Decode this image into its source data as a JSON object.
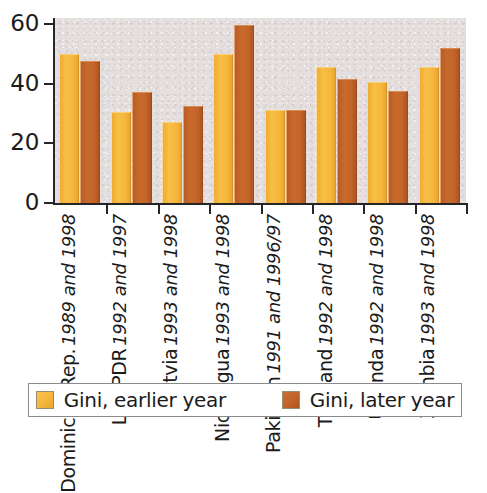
{
  "chart_data": {
    "type": "bar",
    "title": "",
    "subtitle": "",
    "xlabel": "",
    "ylabel": "",
    "ylim": [
      0,
      62
    ],
    "yticks": [
      0,
      20,
      40,
      60
    ],
    "ytick_labels": [
      "0",
      "20",
      "40",
      "60"
    ],
    "grid": false,
    "legend_position": "bottom",
    "categories": [
      "Dominican Rep.",
      "Lao PDR",
      "Latvia",
      "Nicaragua",
      "Pakistan",
      "Thailand",
      "Uganda",
      "Zambia"
    ],
    "category_years": [
      "1989 and 1998",
      "1992 and 1997",
      "1993 and 1998",
      "1993 and 1998",
      "1991 and 1996/97",
      "1992 and 1998",
      "1992 and 1998",
      "1993 and 1998"
    ],
    "series": [
      {
        "name": "Gini, earlier year",
        "color": "#f5b63c",
        "values": [
          50.0,
          30.5,
          27.0,
          50.0,
          31.3,
          45.5,
          40.5,
          45.7
        ]
      },
      {
        "name": "Gini, later year",
        "color": "#c2632a",
        "values": [
          47.5,
          37.3,
          32.5,
          59.8,
          31.3,
          41.5,
          37.5,
          52.0
        ]
      }
    ]
  },
  "legend": {
    "items": [
      {
        "label": "Gini, earlier year"
      },
      {
        "label": "Gini, later year"
      }
    ]
  },
  "colors": {
    "earlier": "#f5b63c",
    "later": "#c2632a",
    "plot_background": "#e4dfde",
    "axis": "#262626",
    "text": "#1b1b1b",
    "legend_border": "#8a8a8a"
  }
}
